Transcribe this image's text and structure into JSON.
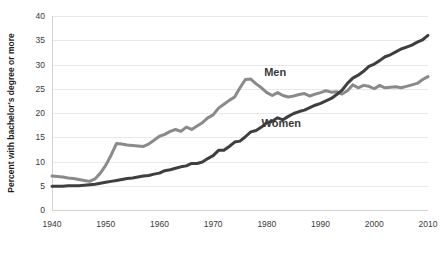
{
  "chart_data": {
    "type": "line",
    "title": "",
    "subtitle": "",
    "xlabel": "",
    "ylabel": "Percent with bachelor's degree or more",
    "xlim": [
      1940,
      2010
    ],
    "ylim": [
      0,
      40
    ],
    "grid": "horizontal",
    "legend_position": "inline-annotations",
    "background_color": "#ffffff",
    "gridline_color": "#e9e9e9",
    "x_ticks": [
      1940,
      1950,
      1960,
      1970,
      1980,
      1990,
      2000,
      2010
    ],
    "x_tick_labels": [
      "1940",
      "1950",
      "1960",
      "1970",
      "1980",
      "1990",
      "2000",
      "2010"
    ],
    "y_ticks": [
      0,
      5,
      10,
      15,
      20,
      25,
      30,
      35,
      40
    ],
    "y_tick_labels": [
      "0",
      "5",
      "10",
      "15",
      "20",
      "25",
      "30",
      "35",
      "40"
    ],
    "annotations": [
      {
        "text": "Men",
        "x": 1979.5,
        "y": 27.6,
        "color": "#3b3b3b"
      },
      {
        "text": "Women",
        "x": 1979.0,
        "y": 17.2,
        "color": "#3b3b3b"
      }
    ],
    "series": [
      {
        "name": "Men",
        "color": "#8a8a8a",
        "stroke_width": 3.0,
        "x": [
          1940,
          1941,
          1942,
          1943,
          1944,
          1945,
          1946,
          1947,
          1948,
          1949,
          1950,
          1951,
          1952,
          1953,
          1954,
          1955,
          1956,
          1957,
          1958,
          1959,
          1960,
          1961,
          1962,
          1963,
          1964,
          1965,
          1966,
          1967,
          1968,
          1969,
          1970,
          1971,
          1972,
          1973,
          1974,
          1975,
          1976,
          1977,
          1978,
          1979,
          1980,
          1981,
          1982,
          1983,
          1984,
          1985,
          1986,
          1987,
          1988,
          1989,
          1990,
          1991,
          1992,
          1993,
          1994,
          1995,
          1996,
          1997,
          1998,
          1999,
          2000,
          2001,
          2002,
          2003,
          2004,
          2005,
          2006,
          2007,
          2008,
          2009,
          2010
        ],
        "values": [
          7.0,
          6.9,
          6.8,
          6.6,
          6.5,
          6.3,
          6.1,
          5.9,
          6.4,
          7.6,
          9.2,
          11.3,
          13.7,
          13.6,
          13.4,
          13.3,
          13.2,
          13.1,
          13.6,
          14.4,
          15.2,
          15.6,
          16.2,
          16.6,
          16.2,
          17.1,
          16.6,
          17.3,
          18.0,
          19.0,
          19.6,
          21.0,
          21.8,
          22.6,
          23.3,
          25.2,
          26.9,
          27.0,
          26.0,
          25.2,
          24.2,
          23.6,
          24.2,
          23.6,
          23.3,
          23.5,
          23.8,
          24.0,
          23.5,
          23.9,
          24.2,
          24.6,
          24.3,
          24.4,
          23.9,
          24.6,
          25.8,
          25.2,
          25.7,
          25.5,
          25.0,
          25.7,
          25.2,
          25.3,
          25.4,
          25.2,
          25.5,
          25.8,
          26.1,
          26.9,
          27.5
        ]
      },
      {
        "name": "Women",
        "color": "#3f3f3f",
        "stroke_width": 3.0,
        "x": [
          1940,
          1941,
          1942,
          1943,
          1944,
          1945,
          1946,
          1947,
          1948,
          1949,
          1950,
          1951,
          1952,
          1953,
          1954,
          1955,
          1956,
          1957,
          1958,
          1959,
          1960,
          1961,
          1962,
          1963,
          1964,
          1965,
          1966,
          1967,
          1968,
          1969,
          1970,
          1971,
          1972,
          1973,
          1974,
          1975,
          1976,
          1977,
          1978,
          1979,
          1980,
          1981,
          1982,
          1983,
          1984,
          1985,
          1986,
          1987,
          1988,
          1989,
          1990,
          1991,
          1992,
          1993,
          1994,
          1995,
          1996,
          1997,
          1998,
          1999,
          2000,
          2001,
          2002,
          2003,
          2004,
          2005,
          2006,
          2007,
          2008,
          2009,
          2010
        ],
        "values": [
          4.9,
          4.9,
          4.9,
          5.0,
          5.0,
          5.0,
          5.1,
          5.2,
          5.3,
          5.5,
          5.7,
          5.9,
          6.1,
          6.3,
          6.5,
          6.6,
          6.8,
          7.0,
          7.1,
          7.4,
          7.6,
          8.1,
          8.3,
          8.6,
          8.9,
          9.1,
          9.6,
          9.6,
          9.9,
          10.6,
          11.2,
          12.3,
          12.3,
          13.1,
          14.0,
          14.2,
          15.1,
          16.1,
          16.4,
          17.1,
          18.0,
          18.3,
          19.0,
          18.6,
          19.3,
          19.9,
          20.3,
          20.6,
          21.1,
          21.6,
          22.0,
          22.5,
          23.0,
          23.8,
          24.7,
          26.1,
          27.2,
          27.8,
          28.6,
          29.6,
          30.1,
          30.8,
          31.6,
          32.0,
          32.6,
          33.2,
          33.6,
          34.0,
          34.6,
          35.1,
          36.0
        ]
      }
    ]
  }
}
